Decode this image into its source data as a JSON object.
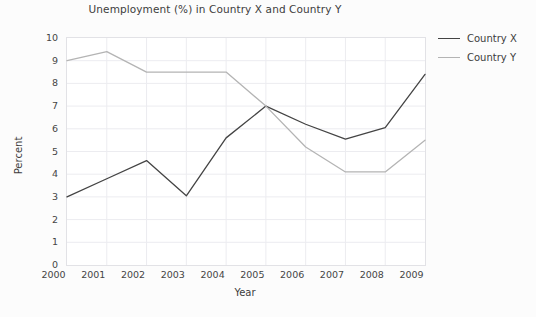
{
  "chart_data": {
    "type": "line",
    "title": "Unemployment (%) in Country X and Country Y",
    "xlabel": "Year",
    "ylabel": "Percent",
    "categories": [
      "2000",
      "2001",
      "2002",
      "2003",
      "2004",
      "2005",
      "2006",
      "2007",
      "2008",
      "2009"
    ],
    "x": [
      2000,
      2001,
      2002,
      2003,
      2004,
      2005,
      2006,
      2007,
      2008,
      2009
    ],
    "xlim": [
      2000,
      2009
    ],
    "ylim": [
      0,
      10
    ],
    "yticks": [
      0,
      1,
      2,
      3,
      4,
      5,
      6,
      7,
      8,
      9,
      10
    ],
    "grid": true,
    "legend_position": "right",
    "series": [
      {
        "name": "Country X",
        "color": "#444444",
        "values": [
          3.0,
          3.8,
          4.6,
          3.05,
          5.6,
          7.0,
          6.2,
          5.55,
          6.05,
          8.4
        ]
      },
      {
        "name": "Country Y",
        "color": "#b4b4b4",
        "values": [
          9.0,
          9.4,
          8.5,
          8.5,
          8.5,
          7.0,
          5.2,
          4.1,
          4.1,
          5.5
        ]
      }
    ]
  },
  "figure": {
    "background_color": "#fcfcfc",
    "plot_background_color": "#ffffff",
    "grid_color": "#ececf0",
    "axis_border_color": "#e2e2e6"
  }
}
